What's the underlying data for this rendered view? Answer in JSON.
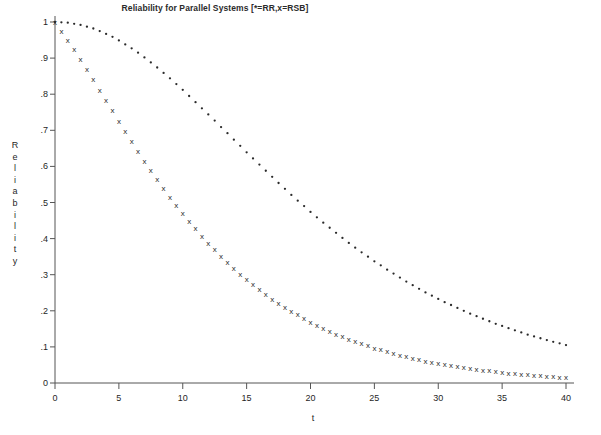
{
  "chart_data": {
    "type": "scatter",
    "title": "Reliability for Parallel Systems [*=RR,x=RSB]",
    "xlabel": "t",
    "ylabel": "Reliability",
    "ylabel_letters": [
      "R",
      "e",
      "l",
      "i",
      "a",
      "b",
      "i",
      "l",
      "i",
      "t",
      "y"
    ],
    "xlim": [
      0,
      41
    ],
    "ylim": [
      0,
      1.02
    ],
    "grid": false,
    "legend_position": "in-title",
    "xticks": [
      0,
      5,
      10,
      15,
      20,
      25,
      30,
      35,
      40
    ],
    "xtick_labels": [
      "0",
      "5",
      "10",
      "15",
      "20",
      "25",
      "30",
      "35",
      "40"
    ],
    "yticks": [
      0,
      0.1,
      0.2,
      0.3,
      0.4,
      0.5,
      0.6,
      0.7,
      0.8,
      0.9,
      1.0
    ],
    "ytick_labels": [
      "0",
      ".1",
      ".2",
      ".3",
      ".4",
      ".5",
      ".6",
      ".7",
      ".8",
      ".9",
      "1"
    ],
    "series": [
      {
        "name": "RR",
        "marker": "*",
        "legend_symbol": "*",
        "color": "#2a2a2a",
        "x": [
          0,
          0.5,
          1,
          1.5,
          2,
          2.5,
          3,
          3.5,
          4,
          4.5,
          5,
          5.5,
          6,
          6.5,
          7,
          7.5,
          8,
          8.5,
          9,
          9.5,
          10,
          10.5,
          11,
          11.5,
          12,
          12.5,
          13,
          13.5,
          14,
          14.5,
          15,
          15.5,
          16,
          16.5,
          17,
          17.5,
          18,
          18.5,
          19,
          19.5,
          20,
          20.5,
          21,
          21.5,
          22,
          22.5,
          23,
          23.5,
          24,
          24.5,
          25,
          25.5,
          26,
          26.5,
          27,
          27.5,
          28,
          28.5,
          29,
          29.5,
          30,
          30.5,
          31,
          31.5,
          32,
          32.5,
          33,
          33.5,
          34,
          34.5,
          35,
          35.5,
          36,
          36.5,
          37,
          37.5,
          38,
          38.5,
          39,
          39.5,
          40
        ],
        "y": [
          1.0,
          0.999,
          0.998,
          0.995,
          0.992,
          0.987,
          0.982,
          0.975,
          0.967,
          0.959,
          0.949,
          0.938,
          0.927,
          0.915,
          0.902,
          0.888,
          0.874,
          0.859,
          0.844,
          0.828,
          0.812,
          0.795,
          0.778,
          0.761,
          0.744,
          0.727,
          0.709,
          0.692,
          0.674,
          0.657,
          0.639,
          0.622,
          0.605,
          0.588,
          0.571,
          0.554,
          0.538,
          0.521,
          0.505,
          0.49,
          0.474,
          0.459,
          0.444,
          0.43,
          0.416,
          0.402,
          0.388,
          0.375,
          0.362,
          0.35,
          0.337,
          0.326,
          0.314,
          0.303,
          0.292,
          0.281,
          0.271,
          0.261,
          0.251,
          0.242,
          0.233,
          0.224,
          0.216,
          0.208,
          0.2,
          0.192,
          0.185,
          0.178,
          0.171,
          0.164,
          0.158,
          0.152,
          0.146,
          0.14,
          0.134,
          0.129,
          0.124,
          0.119,
          0.114,
          0.11,
          0.105
        ]
      },
      {
        "name": "RSB",
        "marker": "x",
        "legend_symbol": "x",
        "color": "#2a2a2a",
        "x": [
          0,
          0.5,
          1,
          1.5,
          2,
          2.5,
          3,
          3.5,
          4,
          4.5,
          5,
          5.5,
          6,
          6.5,
          7,
          7.5,
          8,
          8.5,
          9,
          9.5,
          10,
          10.5,
          11,
          11.5,
          12,
          12.5,
          13,
          13.5,
          14,
          14.5,
          15,
          15.5,
          16,
          16.5,
          17,
          17.5,
          18,
          18.5,
          19,
          19.5,
          20,
          20.5,
          21,
          21.5,
          22,
          22.5,
          23,
          23.5,
          24,
          24.5,
          25,
          25.5,
          26,
          26.5,
          27,
          27.5,
          28,
          28.5,
          29,
          29.5,
          30,
          30.5,
          31,
          31.5,
          32,
          32.5,
          33,
          33.5,
          34,
          34.5,
          35,
          35.5,
          36,
          36.5,
          37,
          37.5,
          38,
          38.5,
          39,
          39.5,
          40
        ],
        "y": [
          1.0,
          0.976,
          0.951,
          0.924,
          0.897,
          0.869,
          0.841,
          0.812,
          0.783,
          0.755,
          0.726,
          0.698,
          0.67,
          0.643,
          0.616,
          0.59,
          0.565,
          0.54,
          0.516,
          0.493,
          0.47,
          0.449,
          0.428,
          0.408,
          0.389,
          0.37,
          0.352,
          0.335,
          0.319,
          0.303,
          0.288,
          0.274,
          0.26,
          0.247,
          0.234,
          0.222,
          0.211,
          0.2,
          0.19,
          0.18,
          0.17,
          0.161,
          0.153,
          0.145,
          0.137,
          0.13,
          0.123,
          0.116,
          0.11,
          0.104,
          0.098,
          0.093,
          0.088,
          0.083,
          0.078,
          0.074,
          0.07,
          0.066,
          0.062,
          0.059,
          0.055,
          0.052,
          0.049,
          0.046,
          0.044,
          0.041,
          0.039,
          0.037,
          0.035,
          0.033,
          0.031,
          0.029,
          0.027,
          0.026,
          0.024,
          0.023,
          0.021,
          0.02,
          0.019,
          0.018,
          0.017
        ]
      }
    ]
  }
}
